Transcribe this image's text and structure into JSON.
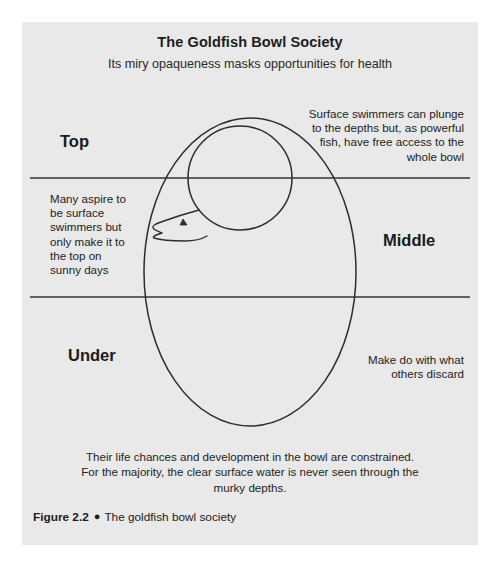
{
  "figure": {
    "title": "The Goldfish Bowl Society",
    "subtitle": "Its miry opaqueness masks opportunities for health",
    "caption": {
      "number": "Figure 2.2",
      "bullet": "●",
      "text": "The goldfish bowl society"
    }
  },
  "zones": {
    "top": "Top",
    "middle": "Middle",
    "under": "Under"
  },
  "annotations": {
    "surface": "Surface swimmers can plunge to the depths but, as powerful fish, have free access to the whole bowl",
    "aspire": "Many aspire to be surface swimmers but only make it to the top on sunny days",
    "discard": "Make do with what others discard",
    "bottom": "Their life chances and development in the bowl are constrained. For the majority, the clear surface water is never seen through the murky depths."
  },
  "icons": {
    "bowl": "goldfish-bowl-outline",
    "fish": "goldfish-head",
    "caption_bullet": "filled-circle-bullet"
  },
  "colors": {
    "page_background": "#ffffff",
    "panel_background": "#e9e9e9",
    "line": "#333333",
    "text": "#1c1c1c"
  }
}
